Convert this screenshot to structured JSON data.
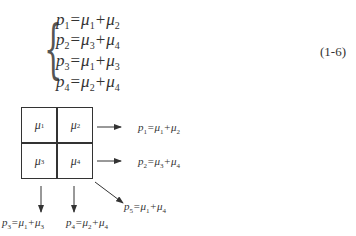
{
  "equation": {
    "number": "(1-6)",
    "lines": [
      {
        "lhs": "p",
        "lhs_sub": "1",
        "a": "μ",
        "a_sub": "1",
        "b": "μ",
        "b_sub": "2"
      },
      {
        "lhs": "p",
        "lhs_sub": "2",
        "a": "μ",
        "a_sub": "3",
        "b": "μ",
        "b_sub": "4"
      },
      {
        "lhs": "p",
        "lhs_sub": "3",
        "a": "μ",
        "a_sub": "1",
        "b": "μ",
        "b_sub": "3"
      },
      {
        "lhs": "p",
        "lhs_sub": "4",
        "a": "μ",
        "a_sub": "2",
        "b": "μ",
        "b_sub": "4"
      }
    ],
    "eq_sign": "=",
    "plus_sign": "+"
  },
  "diagram": {
    "cells": [
      {
        "sym": "μ",
        "sub": "1"
      },
      {
        "sym": "μ",
        "sub": "2"
      },
      {
        "sym": "μ",
        "sub": "3"
      },
      {
        "sym": "μ",
        "sub": "4"
      }
    ],
    "outputs": [
      {
        "p": "p",
        "p_sub": "1",
        "a_sub": "1",
        "b_sub": "2"
      },
      {
        "p": "p",
        "p_sub": "2",
        "a_sub": "3",
        "b_sub": "4"
      },
      {
        "p": "p",
        "p_sub": "3",
        "a_sub": "1",
        "b_sub": "3"
      },
      {
        "p": "p",
        "p_sub": "4",
        "a_sub": "2",
        "b_sub": "4"
      },
      {
        "p": "p",
        "p_sub": "5",
        "a_sub": "1",
        "b_sub": "4"
      }
    ],
    "mu": "μ"
  }
}
